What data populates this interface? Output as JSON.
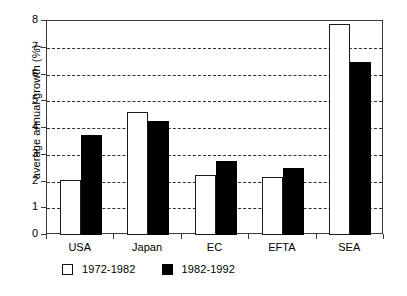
{
  "chart_data": {
    "type": "bar",
    "title": "",
    "subtitle": "",
    "xlabel": "",
    "ylabel": "average annual growth (%)",
    "categories": [
      "USA",
      "Japan",
      "EC",
      "EFTA",
      "SEA"
    ],
    "series": [
      {
        "name": "1972-1982",
        "color": "#ffffff",
        "edge_color": "#000000",
        "values": [
          2.05,
          4.6,
          2.25,
          2.18,
          7.88
        ]
      },
      {
        "name": "1982-1992",
        "color": "#000000",
        "edge_color": "#000000",
        "values": [
          3.72,
          4.25,
          2.75,
          2.5,
          6.45
        ]
      }
    ],
    "ylim": [
      0,
      8
    ],
    "ytick_labels": [
      "0",
      "1",
      "2",
      "3",
      "4",
      "5",
      "6",
      "7",
      "8"
    ],
    "ytick_values": [
      0,
      1,
      2,
      3,
      4,
      5,
      6,
      7,
      8
    ],
    "grid": "horizontal-dashed",
    "grid_color": "#2f2f2f",
    "legend_position": "below-left",
    "frame": "full-box",
    "background": "#ffffff"
  },
  "legend": {
    "items": [
      {
        "label": "1972-1982",
        "swatch": "open-square-swatch"
      },
      {
        "label": "1982-1992",
        "swatch": "filled-square-swatch"
      }
    ]
  }
}
